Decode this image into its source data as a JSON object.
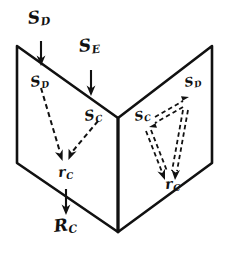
{
  "figure": {
    "kind": "hand-drawn-vector-flux-diagram",
    "ink_color": "#111111",
    "background_color": "#ffffff"
  },
  "labels": {
    "outer_sd": {
      "base": "S",
      "sub": "D"
    },
    "outer_se": {
      "base": "S",
      "sub": "E"
    },
    "left_sd": {
      "base": "S",
      "sub": "D"
    },
    "left_sc": {
      "base": "S",
      "sub": "C"
    },
    "left_rc": {
      "base": "r",
      "sub": "C"
    },
    "right_sd": {
      "base": "S",
      "sub": "D"
    },
    "right_sc": {
      "base": "S",
      "sub": "C"
    },
    "right_rc": {
      "base": "r",
      "sub": "C"
    },
    "outer_rc": {
      "base": "R",
      "sub": "C"
    }
  },
  "panels": {
    "left": {
      "name": "left-panel",
      "points": "17,46 118,118 118,232 17,163"
    },
    "right": {
      "name": "right-panel",
      "points": "212,46 118,118 118,232 212,163"
    },
    "fold": {
      "name": "fold-line",
      "from": "118,118",
      "to": "118,232"
    }
  },
  "arrows": {
    "outer_sd": {
      "from": "41,42",
      "to": "41,62",
      "style": "solid"
    },
    "outer_se": {
      "from": "91,70",
      "to": "91,92",
      "style": "solid"
    },
    "left_sd": {
      "from": "41,88",
      "to": "61,158",
      "style": "dashed"
    },
    "left_sc": {
      "from": "97,121",
      "to": "69,157",
      "style": "dashed"
    },
    "outer_rc": {
      "from": "66,190",
      "to": "66,212",
      "style": "solid"
    },
    "right_sc_to_sd": {
      "from": "152,117",
      "to": "185,99",
      "style": "double-dashed"
    },
    "right_sd_to_sc": {
      "from": "185,105",
      "to": "152,123",
      "style": "double-dashed"
    },
    "right_sc_to_rc": {
      "from": "148,128",
      "to": "166,178",
      "style": "double-dashed"
    },
    "right_sd_to_rc": {
      "from": "186,108",
      "to": "175,177",
      "style": "double-dashed"
    }
  }
}
